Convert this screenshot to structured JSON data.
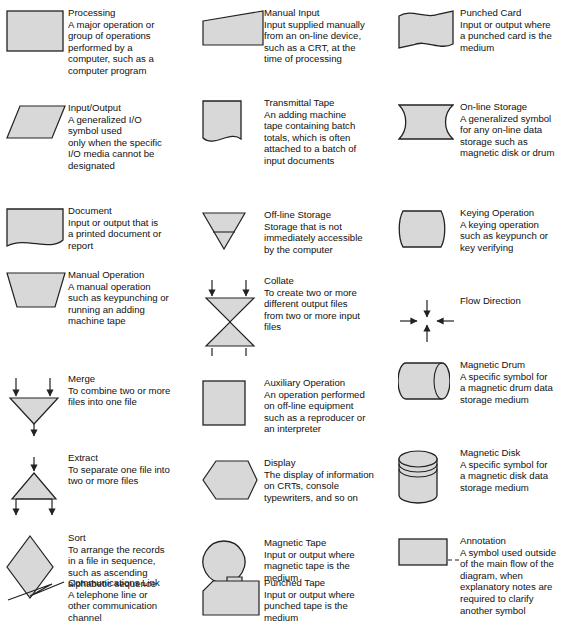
{
  "diagram": {
    "fill_color": "#d8d8d8",
    "stroke_color": "#222222",
    "background": "#ffffff"
  },
  "columns": [
    {
      "name": "column-left",
      "entries": [
        {
          "symbol": "processing-symbol",
          "shape": "rectangle",
          "title": "Processing",
          "lines": [
            "A major operation or",
            "group of operations",
            "performed by a",
            "computer, such as a",
            "computer program"
          ]
        },
        {
          "symbol": "input-output-symbol",
          "shape": "parallelogram",
          "title": "Input/Output",
          "lines": [
            "A generalized I/O",
            "symbol used",
            "only when the specific",
            "I/O media cannot be",
            "designated"
          ]
        },
        {
          "symbol": "document-symbol",
          "shape": "document",
          "title": "Document",
          "lines": [
            "Input or output that is",
            "a printed document or",
            "report"
          ]
        },
        {
          "symbol": "manual-operation-symbol",
          "shape": "trapezoid",
          "title": "Manual Operation",
          "lines": [
            "A manual operation",
            "such as keypunching or",
            "running an adding",
            "machine tape"
          ]
        },
        {
          "symbol": "merge-symbol",
          "shape": "merge",
          "title": "Merge",
          "lines": [
            "To combine two or more",
            "files into one file"
          ]
        },
        {
          "symbol": "extract-symbol",
          "shape": "extract",
          "title": "Extract",
          "lines": [
            "To separate one file into",
            "two or more files"
          ]
        },
        {
          "symbol": "sort-symbol",
          "shape": "diamond",
          "title": "Sort",
          "lines": [
            "To arrange the records",
            "in a file in sequence,",
            "such as ascending",
            "alphabetic sequence"
          ]
        },
        {
          "symbol": "communications-link-symbol",
          "shape": "zigzag",
          "title": "Communications Link",
          "lines": [
            "A telephone line or",
            "other communication",
            "channel"
          ]
        }
      ]
    },
    {
      "name": "column-middle",
      "entries": [
        {
          "symbol": "manual-input-symbol",
          "shape": "manual-input",
          "title": "Manual Input",
          "lines": [
            "Input supplied manually",
            "from an on-line device,",
            "such as a CRT, at the",
            "time of processing"
          ]
        },
        {
          "symbol": "transmittal-tape-symbol",
          "shape": "transmittal-tape",
          "title": "Transmittal Tape",
          "lines": [
            "An adding machine",
            "tape containing batch",
            "totals, which is often",
            "attached to a batch of",
            "input documents"
          ]
        },
        {
          "symbol": "offline-storage-symbol",
          "shape": "inverted-triangle",
          "title": "Off-line Storage",
          "lines": [
            "Storage that is not",
            "immediately accessible",
            "by the computer"
          ]
        },
        {
          "symbol": "collate-symbol",
          "shape": "collate",
          "title": "Collate",
          "lines": [
            "To create two or more",
            "different output files",
            "from two or more input",
            "files"
          ]
        },
        {
          "symbol": "auxiliary-operation-symbol",
          "shape": "square",
          "title": "Auxiliary Operation",
          "lines": [
            "An operation performed",
            "on off-line equipment",
            "such as a reproducer or",
            "an interpreter"
          ]
        },
        {
          "symbol": "display-symbol",
          "shape": "display",
          "title": "Display",
          "lines": [
            "The display of information",
            "on CRTs, console",
            "typewriters, and so on"
          ]
        },
        {
          "symbol": "magnetic-tape-symbol",
          "shape": "magnetic-tape",
          "title": "Magnetic Tape",
          "lines": [
            "Input or output where",
            "magnetic tape is the",
            "medium"
          ]
        },
        {
          "symbol": "punched-tape-symbol",
          "shape": "punched-tape",
          "title": "Punched Tape",
          "lines": [
            "Input or output where",
            "punched tape is the",
            "medium"
          ]
        }
      ]
    },
    {
      "name": "column-right",
      "entries": [
        {
          "symbol": "punched-card-symbol",
          "shape": "punched-card",
          "title": "Punched Card",
          "lines": [
            "Input or output where",
            "a punched card is the",
            "medium"
          ]
        },
        {
          "symbol": "online-storage-symbol",
          "shape": "online-storage",
          "title": "On-line Storage",
          "lines": [
            "A generalized symbol",
            "for any on-line data",
            "storage such as",
            "magnetic disk or drum"
          ]
        },
        {
          "symbol": "keying-operation-symbol",
          "shape": "keying-operation",
          "title": "Keying Operation",
          "lines": [
            "A keying operation",
            "such as keypunch or",
            "key verifying"
          ]
        },
        {
          "symbol": "flow-direction-symbol",
          "shape": "flow-direction",
          "title": "Flow Direction",
          "lines": []
        },
        {
          "symbol": "magnetic-drum-symbol",
          "shape": "magnetic-drum",
          "title": "Magnetic Drum",
          "lines": [
            "A specific symbol for",
            "a magnetic drum data",
            "storage medium"
          ]
        },
        {
          "symbol": "magnetic-disk-symbol",
          "shape": "magnetic-disk",
          "title": "Magnetic Disk",
          "lines": [
            "A specific symbol for",
            "a magnetic disk data",
            "storage medium"
          ]
        },
        {
          "symbol": "annotation-symbol",
          "shape": "annotation",
          "title": "Annotation",
          "lines": [
            "A symbol used outside",
            "of the main flow of the",
            "diagram, when",
            "explanatory notes are",
            "required to clarify",
            "another symbol"
          ]
        }
      ]
    }
  ],
  "layout": {
    "col_tops": [
      [
        10,
        105,
        208,
        272,
        376,
        455,
        535,
        580
      ],
      [
        10,
        100,
        212,
        278,
        380,
        460,
        540,
        580
      ],
      [
        10,
        104,
        210,
        298,
        362,
        450,
        538
      ]
    ]
  }
}
